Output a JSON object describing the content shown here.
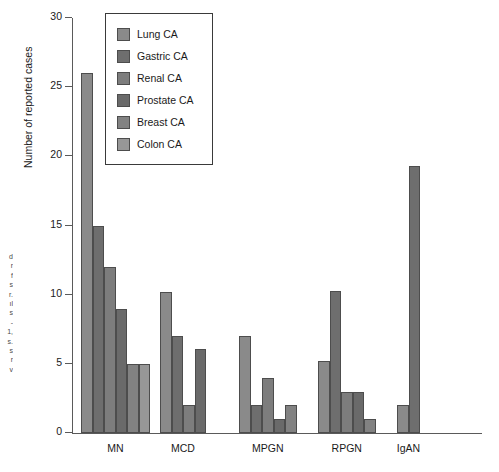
{
  "chart_data": {
    "type": "bar",
    "title": "",
    "xlabel": "",
    "ylabel": "Number of reported cases",
    "ylim": [
      0,
      30
    ],
    "yticks": [
      0,
      5,
      10,
      15,
      20,
      25,
      30
    ],
    "grid": false,
    "legend_position": "top-center",
    "categories": [
      "MN",
      "MCD",
      "MPGN",
      "RPGN",
      "IgAN"
    ],
    "series": [
      {
        "name": "Lung CA",
        "color": "#8a8a8a",
        "values": [
          26,
          10.2,
          7,
          5.2,
          2
        ]
      },
      {
        "name": "Gastric CA",
        "color": "#6e6e6e",
        "values": [
          15,
          7,
          2,
          10.3,
          19.3
        ]
      },
      {
        "name": "Renal CA",
        "color": "#7d7d7d",
        "values": [
          12,
          2,
          4,
          3,
          null
        ]
      },
      {
        "name": "Prostate CA",
        "color": "#6a6a6a",
        "values": [
          9,
          6.1,
          1,
          3,
          null
        ]
      },
      {
        "name": "Breast CA",
        "color": "#828282",
        "values": [
          5,
          null,
          2,
          1,
          null
        ]
      },
      {
        "name": "Colon CA",
        "color": "#979797",
        "values": [
          5,
          null,
          null,
          null,
          null
        ]
      }
    ]
  },
  "caption_fragment": {
    "lines": "d\nr\nf\ns\nr.\nıl\ns\n-\n1,\ns.\ns\nr\nv"
  }
}
